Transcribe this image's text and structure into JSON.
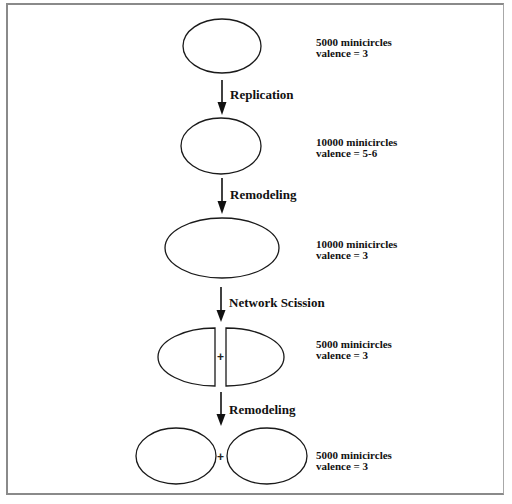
{
  "diagram": {
    "title": "",
    "stages": [
      {
        "id": "stage-1",
        "shape": "ellipse",
        "minicircles": "5000 minicircles",
        "valence": "valence = 3"
      },
      {
        "id": "stage-2",
        "shape": "ellipse",
        "minicircles": "10000 minicircles",
        "valence": "valence = 5-6"
      },
      {
        "id": "stage-3",
        "shape": "elongated-ellipse",
        "minicircles": "10000 minicircles",
        "valence": "valence = 3"
      },
      {
        "id": "stage-4",
        "shape": "split-ellipse-halves",
        "plus": "+",
        "minicircles": "5000 minicircles",
        "valence": "valence = 3"
      },
      {
        "id": "stage-5",
        "shape": "two-ellipses",
        "plus": "+",
        "minicircles": "5000 minicircles",
        "valence": "valence = 3"
      }
    ],
    "transitions": [
      {
        "from": "stage-1",
        "to": "stage-2",
        "label": "Replication"
      },
      {
        "from": "stage-2",
        "to": "stage-3",
        "label": "Remodeling"
      },
      {
        "from": "stage-3",
        "to": "stage-4",
        "label": "Network Scission"
      },
      {
        "from": "stage-4",
        "to": "stage-5",
        "label": "Remodeling"
      }
    ],
    "colors": {
      "stroke": "#1a1a1a",
      "frame": "#8a8a8a",
      "background": "#ffffff"
    }
  }
}
